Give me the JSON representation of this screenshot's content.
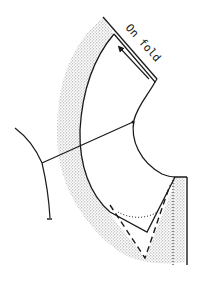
{
  "diagram": {
    "type": "sewing-pattern",
    "label": "On fold",
    "colors": {
      "line": "#1a1a1a",
      "shading": "#b5b5b5",
      "background": "#ffffff"
    },
    "elements": [
      {
        "name": "fold-line",
        "style": "solid"
      },
      {
        "name": "grainline-arrow",
        "style": "solid-arrow"
      },
      {
        "name": "outer-edge-curve",
        "style": "solid"
      },
      {
        "name": "inner-neck-curve",
        "style": "solid"
      },
      {
        "name": "shoulder-line",
        "style": "solid"
      },
      {
        "name": "adjacent-piece-outline",
        "style": "solid"
      },
      {
        "name": "v-neck-dashed",
        "style": "dashed"
      },
      {
        "name": "v-neck-dotted-curve",
        "style": "dotted"
      },
      {
        "name": "center-front-solid",
        "style": "solid"
      },
      {
        "name": "center-front-dotted",
        "style": "dotted"
      },
      {
        "name": "seam-allowance-shading",
        "style": "stipple"
      }
    ]
  }
}
